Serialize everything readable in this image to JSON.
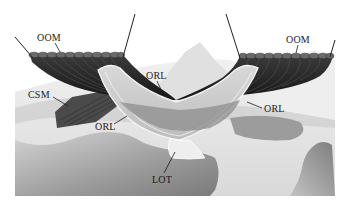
{
  "figure": {
    "labels": [
      {
        "id": "oom_left",
        "text": "OOM",
        "x": 37,
        "y": 33
      },
      {
        "id": "oom_right",
        "text": "OOM",
        "x": 286,
        "y": 35
      },
      {
        "id": "orl_top",
        "text": "ORL",
        "x": 146,
        "y": 73
      },
      {
        "id": "orl_right",
        "text": "ORL",
        "x": 264,
        "y": 105
      },
      {
        "id": "csm",
        "text": "CSM",
        "x": 29,
        "y": 92
      },
      {
        "id": "orl_left",
        "text": "ORL",
        "x": 95,
        "y": 123
      },
      {
        "id": "lot",
        "text": "LOT",
        "x": 153,
        "y": 176
      }
    ],
    "colors": {
      "background": "#ffffff",
      "muscle_dark": "#2b2b2b",
      "muscle_mid": "#4a4a4a",
      "ligament_light": "#c9c9c9",
      "tissue_light": "#e6e6e6",
      "tissue_mid": "#a8a8a8",
      "leader_line": "#1a1a1a"
    }
  }
}
